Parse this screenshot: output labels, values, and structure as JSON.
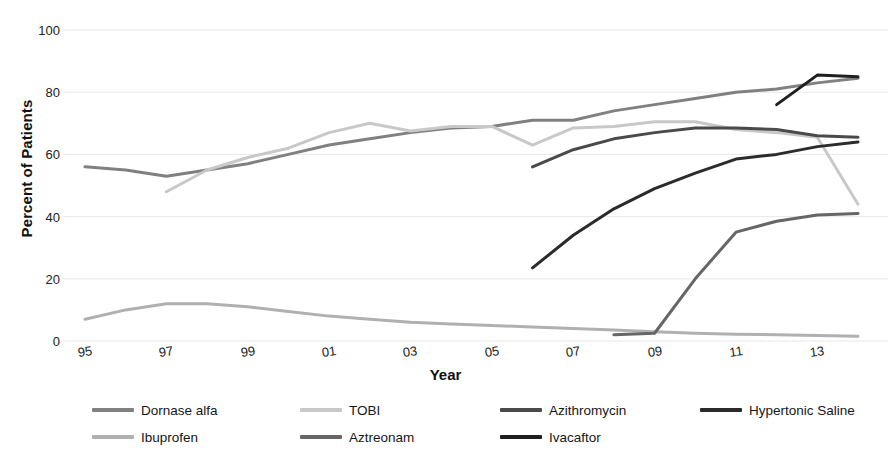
{
  "chart_data": {
    "type": "line",
    "title": "",
    "xlabel": "Year",
    "ylabel": "Percent of Patients",
    "ylim": [
      0,
      100
    ],
    "ytick_labels": [
      "100",
      "80",
      "60",
      "40",
      "20",
      "0"
    ],
    "ytick_values": [
      100,
      80,
      60,
      40,
      20,
      0
    ],
    "xlim": [
      1995,
      2014
    ],
    "x": [
      1995,
      1996,
      1997,
      1998,
      1999,
      2000,
      2001,
      2002,
      2003,
      2004,
      2005,
      2006,
      2007,
      2008,
      2009,
      2010,
      2011,
      2012,
      2013,
      2014
    ],
    "xtick_labels": [
      "95",
      "97",
      "99",
      "01",
      "03",
      "05",
      "07",
      "09",
      "11",
      "13"
    ],
    "xtick_values": [
      1995,
      1997,
      1999,
      2001,
      2003,
      2005,
      2007,
      2009,
      2011,
      2013
    ],
    "grid": true,
    "grid_axis": "y",
    "legend_position": "below",
    "series": [
      {
        "name": "Dornase alfa",
        "color": "#808080",
        "x": [
          1995,
          1996,
          1997,
          1998,
          1999,
          2000,
          2001,
          2002,
          2003,
          2004,
          2005,
          2006,
          2007,
          2008,
          2009,
          2010,
          2011,
          2012,
          2013,
          2014
        ],
        "values": [
          56,
          55,
          53,
          55,
          57,
          60,
          63,
          65,
          67,
          68.5,
          69,
          71,
          71,
          74,
          76,
          78,
          80,
          81,
          83,
          84.5
        ]
      },
      {
        "name": "TOBI",
        "color": "#c8c8c8",
        "x": [
          1997,
          1998,
          1999,
          2000,
          2001,
          2002,
          2003,
          2004,
          2005,
          2006,
          2007,
          2008,
          2009,
          2010,
          2011,
          2012,
          2013,
          2014
        ],
        "values": [
          48,
          55,
          59,
          62,
          67,
          70,
          67.5,
          69,
          69,
          63,
          68.5,
          69,
          70.5,
          70.5,
          68,
          67,
          65.5,
          44
        ]
      },
      {
        "name": "Azithromycin",
        "color": "#4a4a4a",
        "x": [
          2006,
          2007,
          2008,
          2009,
          2010,
          2011,
          2012,
          2013,
          2014
        ],
        "values": [
          56,
          61.5,
          65,
          67,
          68.5,
          68.5,
          68,
          66,
          65.5
        ]
      },
      {
        "name": "Hypertonic Saline",
        "color": "#2b2b2b",
        "x": [
          2006,
          2007,
          2008,
          2009,
          2010,
          2011,
          2012,
          2013,
          2014
        ],
        "values": [
          23.5,
          34,
          42.5,
          49,
          54,
          58.5,
          60,
          62.5,
          64
        ]
      },
      {
        "name": "Ibuprofen",
        "color": "#b0b0b0",
        "x": [
          1995,
          1996,
          1997,
          1998,
          1999,
          2000,
          2001,
          2002,
          2003,
          2004,
          2005,
          2006,
          2007,
          2008,
          2009,
          2010,
          2011,
          2012,
          2013,
          2014
        ],
        "values": [
          7,
          10,
          12,
          12,
          11,
          9.5,
          8,
          7,
          6,
          5.5,
          5,
          4.5,
          4,
          3.5,
          3,
          2.5,
          2.2,
          2,
          1.8,
          1.5
        ]
      },
      {
        "name": "Aztreonam",
        "color": "#666666",
        "x": [
          2008,
          2009,
          2010,
          2011,
          2012,
          2013,
          2014
        ],
        "values": [
          2,
          2.5,
          20,
          35,
          38.5,
          40.5,
          41
        ]
      },
      {
        "name": "Ivacaftor",
        "color": "#1f1f1f",
        "x": [
          2012,
          2013,
          2014
        ],
        "values": [
          76,
          85.5,
          85
        ]
      }
    ]
  },
  "legend": {
    "items": [
      {
        "label": "Dornase alfa",
        "color": "#808080",
        "col": 0,
        "row": 0
      },
      {
        "label": "TOBI",
        "color": "#c8c8c8",
        "col": 1,
        "row": 0
      },
      {
        "label": "Azithromycin",
        "color": "#4a4a4a",
        "col": 2,
        "row": 0
      },
      {
        "label": "Hypertonic Saline",
        "color": "#2b2b2b",
        "col": 3,
        "row": 0
      },
      {
        "label": "Ibuprofen",
        "color": "#b0b0b0",
        "col": 0,
        "row": 1
      },
      {
        "label": "Aztreonam",
        "color": "#666666",
        "col": 1,
        "row": 1
      },
      {
        "label": "Ivacaftor",
        "color": "#1f1f1f",
        "col": 2,
        "row": 1
      }
    ]
  },
  "style": {
    "background": "#ffffff",
    "grid_color": "#e8e8e8",
    "text_color": "#1a1a1a"
  }
}
